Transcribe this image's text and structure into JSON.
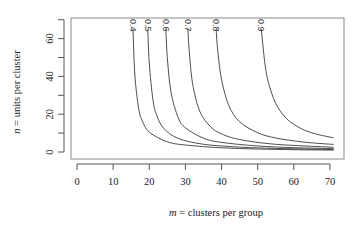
{
  "chart_data": {
    "type": "line",
    "title": "",
    "xlabel_var": "m",
    "xlabel_rest": " = clusters per group",
    "ylabel_var": "n",
    "ylabel_rest": " = units per cluster",
    "xlim": [
      -2,
      73
    ],
    "ylim": [
      -3,
      71
    ],
    "x_ticks": [
      0,
      10,
      20,
      30,
      40,
      50,
      60,
      70
    ],
    "y_ticks": [
      0,
      10,
      20,
      30,
      40,
      50,
      60,
      70
    ],
    "y_tick_labels": [
      "0",
      "",
      "20",
      "",
      "40",
      "",
      "60",
      ""
    ],
    "grid": false,
    "legend": "inline labels at top of each curve",
    "series": [
      {
        "name": "0.4",
        "x": [
          15.5,
          16,
          17,
          18,
          20,
          25,
          30,
          40,
          50,
          60,
          71
        ],
        "y": [
          64.8,
          41.2,
          23.8,
          16.7,
          10.5,
          5.4,
          3.7,
          2.2,
          1.6,
          1.2,
          1.0
        ]
      },
      {
        "name": "0.5",
        "x": [
          19.6,
          20,
          21,
          22,
          24,
          28,
          35,
          45,
          55,
          71
        ],
        "y": [
          64.8,
          46.9,
          27.8,
          19.7,
          12.5,
          7.2,
          4.1,
          2.6,
          1.9,
          1.3
        ]
      },
      {
        "name": "0.6",
        "x": [
          24.6,
          25,
          26,
          28,
          30,
          35,
          40,
          50,
          60,
          71
        ],
        "y": [
          65.2,
          50.0,
          31.6,
          18.2,
          12.8,
          7.3,
          5.1,
          3.2,
          2.3,
          1.8
        ]
      },
      {
        "name": "0.7",
        "x": [
          30.7,
          31,
          32,
          34,
          37,
          40,
          45,
          55,
          71
        ],
        "y": [
          65.2,
          55.0,
          36.1,
          21.4,
          13.3,
          9.6,
          6.6,
          4.1,
          2.5
        ]
      },
      {
        "name": "0.8",
        "x": [
          38.5,
          39,
          40,
          42,
          45,
          50,
          55,
          63,
          71
        ],
        "y": [
          65.0,
          52.7,
          38.2,
          24.6,
          16.0,
          10.2,
          7.4,
          5.2,
          4.0
        ]
      },
      {
        "name": "0.9",
        "x": [
          51,
          52,
          53,
          55,
          58,
          62,
          66,
          71
        ],
        "y": [
          65.0,
          46.9,
          36.7,
          25.6,
          17.6,
          12.4,
          9.6,
          7.5
        ]
      }
    ]
  },
  "colors": {
    "curve": "#3a3a3a",
    "axis": "#555555",
    "box": "#888888",
    "text": "#222222"
  }
}
